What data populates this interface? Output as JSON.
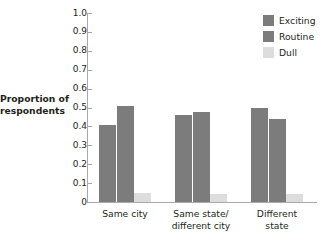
{
  "chart_data": {
    "type": "bar",
    "title": "",
    "xlabel": "",
    "ylabel": "Proportion of respondents",
    "categories": [
      "Same city",
      "Same state/\ndifferent city",
      "Different\nstate"
    ],
    "category_labels": [
      {
        "line1": "Same city",
        "line2": ""
      },
      {
        "line1": "Same state/",
        "line2": "different city"
      },
      {
        "line1": "Different",
        "line2": "state"
      }
    ],
    "series": [
      {
        "name": "Exciting",
        "color": "#7c7c7c",
        "values": [
          0.41,
          0.46,
          0.5
        ]
      },
      {
        "name": "Routine",
        "color": "#7c7c7c",
        "values": [
          0.51,
          0.475,
          0.44
        ]
      },
      {
        "name": "Dull",
        "color": "#dddddd",
        "values": [
          0.05,
          0.045,
          0.045
        ]
      }
    ],
    "ylim": [
      0,
      1.0
    ],
    "ytick_values": [
      0,
      0.1,
      0.2,
      0.3,
      0.4,
      0.5,
      0.6,
      0.7,
      0.8,
      0.9,
      1.0
    ],
    "ytick_labels": [
      "0",
      "0.1",
      "0.2",
      "0.3",
      "0.4",
      "0.5",
      "0.6",
      "0.7",
      "0.8",
      "0.9",
      "1.0"
    ],
    "grid": false,
    "legend_position": "top-right",
    "legend_entries": [
      "Exciting",
      "Routine",
      "Dull"
    ]
  },
  "axis": {
    "y_title_line1": "Proportion of",
    "y_title_line2": "respondents"
  },
  "colors": {
    "bar_dark": "#7c7c7c",
    "bar_light": "#dddddd",
    "axis": "#a9a9a9",
    "text": "#231f20",
    "background": "#ffffff"
  }
}
